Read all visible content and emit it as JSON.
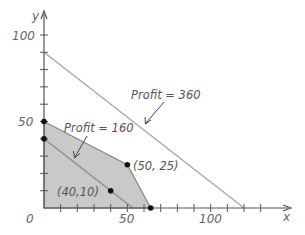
{
  "chart_data": {
    "type": "line",
    "title": "",
    "xlabel": "x",
    "ylabel": "y",
    "xlim": [
      0,
      125
    ],
    "ylim": [
      0,
      112
    ],
    "grid": false,
    "x_ticks": [
      10,
      20,
      30,
      40,
      50,
      60,
      70,
      80,
      90,
      100,
      110,
      120,
      130
    ],
    "y_ticks": [
      10,
      20,
      30,
      40,
      50,
      60,
      70,
      80,
      90,
      100
    ],
    "x_tick_labels": [
      {
        "value": 50,
        "label": "50"
      },
      {
        "value": 100,
        "label": "100"
      }
    ],
    "y_tick_labels": [
      {
        "value": 50,
        "label": "50"
      },
      {
        "value": 100,
        "label": "100"
      }
    ],
    "origin_label": "0",
    "feasible_region": {
      "vertices": [
        [
          0,
          0
        ],
        [
          0,
          50
        ],
        [
          50,
          25
        ],
        [
          64,
          0
        ]
      ],
      "fill": "#c9c9c9"
    },
    "series": [
      {
        "name": "Profit = 160",
        "points": [
          [
            0,
            40
          ],
          [
            53.3,
            0
          ]
        ],
        "color": "#8a8a8a"
      },
      {
        "name": "Profit = 360",
        "points": [
          [
            0,
            90
          ],
          [
            120,
            0
          ]
        ],
        "color": "#a8a8a8"
      }
    ],
    "points": [
      {
        "x": 0,
        "y": 50,
        "label": ""
      },
      {
        "x": 0,
        "y": 40,
        "label": ""
      },
      {
        "x": 50,
        "y": 25,
        "label": "(50, 25)"
      },
      {
        "x": 40,
        "y": 10,
        "label": "(40,10)"
      },
      {
        "x": 64,
        "y": 0,
        "label": ""
      }
    ],
    "annotations": [
      {
        "text": "Profit = 360",
        "arrow_to_line": "Profit = 360"
      },
      {
        "text": "Profit = 160",
        "arrow_to_line": "Profit = 160"
      }
    ]
  },
  "labels": {
    "x_axis": "x",
    "y_axis": "y",
    "origin": "0",
    "x50": "50",
    "x100": "100",
    "y50": "50",
    "y100": "100",
    "profit360": "Profit = 360",
    "profit160": "Profit = 160",
    "pt_50_25": "(50, 25)",
    "pt_40_10": "(40,10)"
  }
}
